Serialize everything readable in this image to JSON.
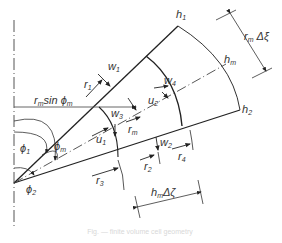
{
  "diagram": {
    "labels": {
      "h1": {
        "base": "h",
        "sub": "1"
      },
      "hm": {
        "base": "h",
        "sub": "m"
      },
      "h2": {
        "base": "h",
        "sub": "2"
      },
      "rm_dxi": {
        "base": "r",
        "sub": "m",
        "rest": " Δξ"
      },
      "hm_dzeta": {
        "base": "h",
        "sub": "m",
        "rest": "Δζ"
      },
      "rm_sin_phim": {
        "base": "r",
        "sub": "m",
        "rest": "sin ϕ",
        "sub2": "m"
      },
      "w1": {
        "base": "w",
        "sub": "1"
      },
      "w2": {
        "base": "w",
        "sub": "2"
      },
      "w3": {
        "base": "w",
        "sub": "3"
      },
      "w4": {
        "base": "w",
        "sub": "4"
      },
      "r1": {
        "base": "r",
        "sub": "1"
      },
      "r2": {
        "base": "r",
        "sub": "2"
      },
      "r3": {
        "base": "r",
        "sub": "3"
      },
      "r4": {
        "base": "r",
        "sub": "4"
      },
      "rm": {
        "base": "r",
        "sub": "m"
      },
      "u1": {
        "base": "u",
        "sub": "1"
      },
      "u2": {
        "base": "u",
        "sub": "2"
      },
      "phi1": {
        "base": "ϕ",
        "sub": "1"
      },
      "phi2": {
        "base": "ϕ",
        "sub": "2"
      },
      "phim": {
        "base": "ϕ",
        "sub": "m"
      }
    },
    "caption": "Fig. — finite volume cell geometry"
  }
}
